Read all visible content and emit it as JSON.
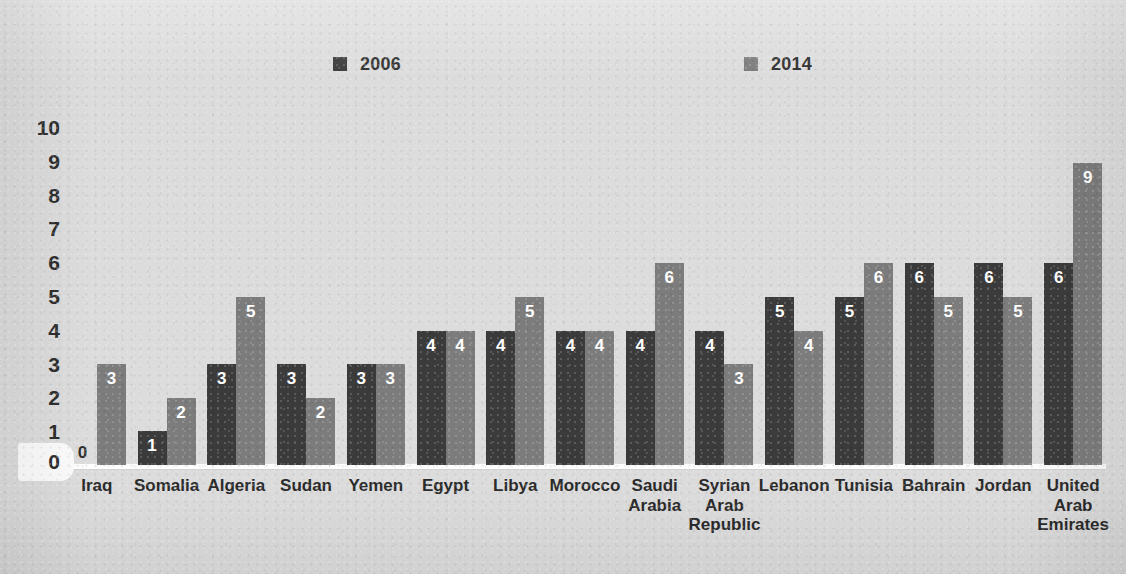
{
  "chart_data": {
    "type": "bar",
    "title": "",
    "subtitle": "",
    "xlabel": "",
    "ylabel": "",
    "ylim": [
      0,
      10
    ],
    "yticks": [
      10,
      9,
      8,
      7,
      6,
      5,
      4,
      3,
      2,
      1,
      0
    ],
    "grid": false,
    "legend_position": "top",
    "categories": [
      "Iraq",
      "Somalia",
      "Algeria",
      "Sudan",
      "Yemen",
      "Egypt",
      "Libya",
      "Morocco",
      "Saudi Arabia",
      "Syrian Arab Republic",
      "Lebanon",
      "Tunisia",
      "Bahrain",
      "Jordan",
      "United Arab Emirates"
    ],
    "category_label_lines": [
      [
        "Iraq"
      ],
      [
        "Somalia"
      ],
      [
        "Algeria"
      ],
      [
        "Sudan"
      ],
      [
        "Yemen"
      ],
      [
        "Egypt"
      ],
      [
        "Libya"
      ],
      [
        "Morocco"
      ],
      [
        "Saudi",
        "Arabia"
      ],
      [
        "Syrian",
        "Arab",
        "Republic"
      ],
      [
        "Lebanon"
      ],
      [
        "Tunisia"
      ],
      [
        "Bahrain"
      ],
      [
        "Jordan"
      ],
      [
        "United",
        "Arab",
        "Emirates"
      ]
    ],
    "series": [
      {
        "name": "2006",
        "color": "#3b3b3b",
        "values": [
          0,
          1,
          3,
          3,
          3,
          4,
          4,
          4,
          4,
          4,
          5,
          5,
          6,
          6,
          6
        ]
      },
      {
        "name": "2014",
        "color": "#7c7c7c",
        "values": [
          3,
          2,
          5,
          2,
          3,
          4,
          5,
          4,
          6,
          3,
          4,
          6,
          5,
          5,
          9
        ]
      }
    ]
  },
  "legend": {
    "entries": [
      {
        "label": "2006",
        "color": "#3b3b3b"
      },
      {
        "label": "2014",
        "color": "#7c7c7c"
      }
    ]
  },
  "axis": {
    "zero_label": "0"
  },
  "colors": {
    "background": "#dcdcdc",
    "series_2006": "#3b3b3b",
    "series_2014": "#7c7c7c",
    "baseline": "#fdfdfd",
    "text": "#2f2f2f",
    "value_text": "#ffffff"
  }
}
